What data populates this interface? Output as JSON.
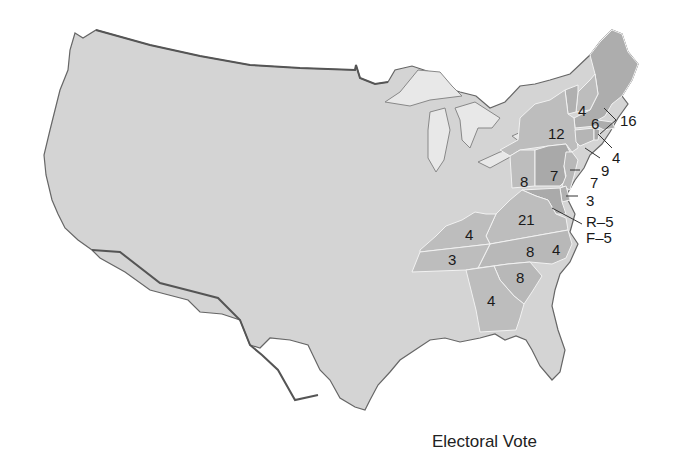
{
  "map": {
    "caption": "Electoral Vote",
    "colors": {
      "land": "#d4d4d4",
      "voting_light": "#bdbdbd",
      "voting_dark": "#a9a9a9",
      "border": "#555555",
      "state_line": "#f2f2f2",
      "water": "#ffffff"
    },
    "labels": {
      "vt": "4",
      "nh": "6",
      "ma": "16",
      "ny": "12",
      "ri": "4",
      "ct": "9",
      "pa_west": "8",
      "pa_east": "7",
      "nj": "7",
      "de": "3",
      "md_r": "R–5",
      "md_f": "F–5",
      "va": "21",
      "ky": "4",
      "nc": "8",
      "nc_east": "4",
      "tn": "3",
      "sc": "8",
      "ga": "4"
    }
  }
}
